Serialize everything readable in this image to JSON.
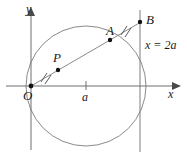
{
  "figure": {
    "type": "geometry-diagram",
    "background_color": "#ffffff",
    "stroke_color": "#8a8a8a",
    "label_color": "#1a1a1a",
    "point_color": "#111111"
  },
  "axes": {
    "x_label": "x",
    "y_label": "y",
    "origin_label": "O",
    "x_tick_label": "a"
  },
  "labels": {
    "point_A": "A",
    "point_B": "B",
    "point_P": "P",
    "vertical_line": "x = 2a"
  },
  "geometry": {
    "origin": {
      "x": 31,
      "y": 86
    },
    "circle": {
      "cx": 86,
      "cy": 86,
      "r": 60
    },
    "vertical_line_x": 140,
    "x_axis": {
      "x1": 6,
      "y1": 86,
      "x2": 175,
      "y2": 86
    },
    "y_axis": {
      "x1": 31,
      "y1": 148,
      "x2": 31,
      "y2": 12
    },
    "ray": {
      "x1": 31,
      "y1": 86,
      "x2": 141,
      "y2": 22
    },
    "points": [
      {
        "name": "P",
        "x": 58,
        "y": 70
      },
      {
        "name": "A",
        "x": 110,
        "y": 40
      },
      {
        "name": "B",
        "x": 140,
        "y": 22
      }
    ],
    "x_tick": {
      "x": 86,
      "y": 86
    },
    "congruence_marks": [
      {
        "segment": "OP",
        "x": 45,
        "y": 78,
        "count": 2
      },
      {
        "segment": "AB",
        "x": 125,
        "y": 31,
        "count": 2
      }
    ]
  }
}
